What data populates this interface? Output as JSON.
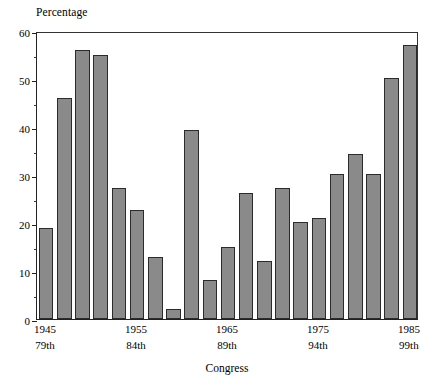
{
  "chart_data": {
    "type": "bar",
    "title": "",
    "ylabel": "Percentage",
    "xlabel": "Congress",
    "ylim": [
      0,
      60
    ],
    "y_ticks": [
      0,
      10,
      20,
      30,
      40,
      50,
      60
    ],
    "y_tick_labels": [
      "0",
      "10",
      "20",
      "30",
      "40",
      "50",
      "60"
    ],
    "y_minor_ticks": [
      5,
      15,
      25,
      35,
      45,
      55
    ],
    "grid": false,
    "legend": "none",
    "categories": [
      "79th",
      "80th",
      "81st",
      "82nd",
      "83rd",
      "84th",
      "85th",
      "86th",
      "87th",
      "88th",
      "89th",
      "90th",
      "91st",
      "92nd",
      "93rd",
      "94th",
      "95th",
      "96th",
      "97th",
      "98th",
      "99th"
    ],
    "values": [
      19.0,
      46.0,
      56.0,
      55.0,
      27.2,
      22.8,
      13.0,
      2.0,
      39.3,
      8.2,
      15.1,
      26.2,
      12.1,
      27.3,
      20.3,
      21.0,
      30.2,
      34.3,
      30.2,
      50.2,
      57.0
    ],
    "x_tick_positions": [
      0,
      5,
      10,
      15,
      20
    ],
    "x_tick_years": [
      "1945",
      "1955",
      "1965",
      "1975",
      "1985"
    ],
    "x_tick_congresses": [
      "79th",
      "84th",
      "89th",
      "94th",
      "99th"
    ],
    "bar_fill_color": "#8a8a8a",
    "bar_edge_color": "#2b2b2b",
    "axis_color": "#222222",
    "background_color": "#ffffff"
  }
}
